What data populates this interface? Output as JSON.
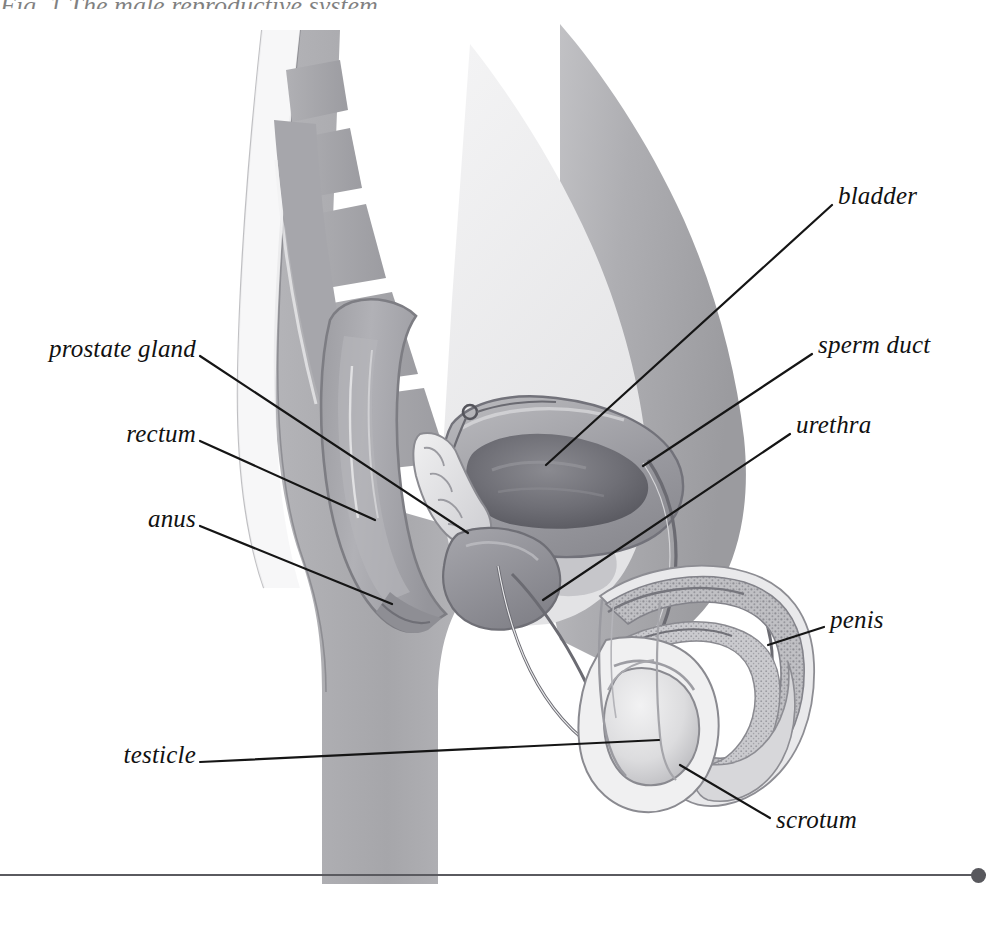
{
  "figure": {
    "title_fragment": "Fig. 1  The male reproductive system",
    "type": "anatomical-cross-section",
    "subject": "male reproductive system",
    "view": "sagittal section, facing right",
    "palette": {
      "background": "#ffffff",
      "body_tissue": "#a9a9ac",
      "body_tissue_light": "#c9c9cc",
      "cavity_light": "#efeff0",
      "organ_mid": "#8f8f94",
      "organ_dark": "#6e6e74",
      "bladder_cavity": "#5d5d63",
      "outline": "#6b6b70",
      "leader_line": "#151515",
      "label_text": "#111111",
      "baseline": "#5a5a5f"
    }
  },
  "labels": [
    {
      "id": "prostate-gland",
      "text": "prostate gland",
      "side": "left",
      "x": 196,
      "y": 349,
      "leader": {
        "x1": 200,
        "y1": 356,
        "x2": 468,
        "y2": 533
      }
    },
    {
      "id": "rectum",
      "text": "rectum",
      "side": "left",
      "x": 196,
      "y": 434,
      "leader": {
        "x1": 200,
        "y1": 441,
        "x2": 375,
        "y2": 520
      }
    },
    {
      "id": "anus",
      "text": "anus",
      "side": "left",
      "x": 196,
      "y": 519,
      "leader": {
        "x1": 200,
        "y1": 526,
        "x2": 392,
        "y2": 604
      }
    },
    {
      "id": "testicle",
      "text": "testicle",
      "side": "left",
      "x": 196,
      "y": 755,
      "leader": {
        "x1": 200,
        "y1": 762,
        "x2": 659,
        "y2": 740
      }
    },
    {
      "id": "bladder",
      "text": "bladder",
      "side": "right",
      "x": 838,
      "y": 196,
      "leader": {
        "x1": 832,
        "y1": 205,
        "x2": 546,
        "y2": 465
      }
    },
    {
      "id": "sperm-duct",
      "text": "sperm duct",
      "side": "right",
      "x": 818,
      "y": 345,
      "leader": {
        "x1": 812,
        "y1": 354,
        "x2": 643,
        "y2": 466
      }
    },
    {
      "id": "urethra",
      "text": "urethra",
      "side": "right",
      "x": 796,
      "y": 425,
      "leader": {
        "x1": 790,
        "y1": 434,
        "x2": 543,
        "y2": 600
      }
    },
    {
      "id": "penis",
      "text": "penis",
      "side": "right",
      "x": 830,
      "y": 620,
      "leader": {
        "x1": 824,
        "y1": 627,
        "x2": 768,
        "y2": 645
      }
    },
    {
      "id": "scrotum",
      "text": "scrotum",
      "side": "right",
      "x": 776,
      "y": 820,
      "leader": {
        "x1": 770,
        "y1": 818,
        "x2": 680,
        "y2": 765
      }
    }
  ],
  "baseline": {
    "present": true,
    "dot_position": "right-end"
  }
}
